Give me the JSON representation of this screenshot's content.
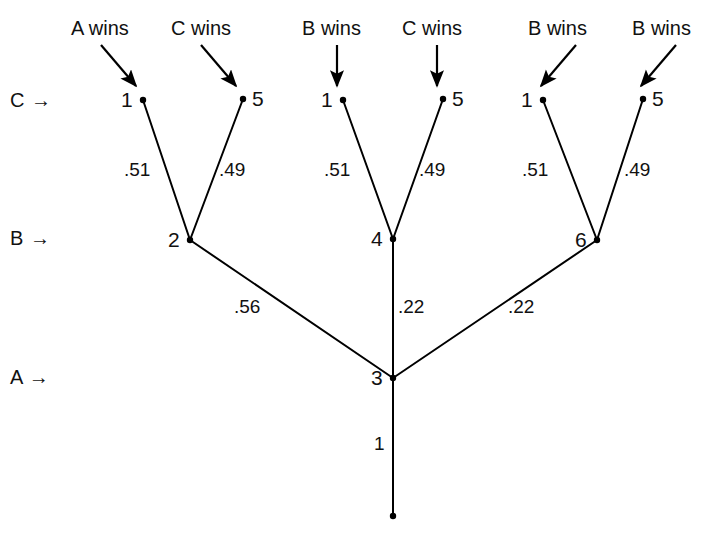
{
  "figure": {
    "type": "tree-diagram",
    "background": "#ffffff",
    "ink": "#000000",
    "width": 715,
    "height": 538
  },
  "row_labels": [
    {
      "text": "C →",
      "x": 10,
      "y": 90
    },
    {
      "text": "B →",
      "x": 10,
      "y": 228
    },
    {
      "text": "A →",
      "x": 10,
      "y": 367
    }
  ],
  "captions": [
    {
      "text": "A wins",
      "x": 71,
      "y": 18,
      "arrow": "diagonal-right-down"
    },
    {
      "text": "C wins",
      "x": 171,
      "y": 18,
      "arrow": "diagonal-right-down"
    },
    {
      "text": "B wins",
      "x": 302,
      "y": 18,
      "arrow": "vertical-down"
    },
    {
      "text": "C wins",
      "x": 402,
      "y": 18,
      "arrow": "vertical-down"
    },
    {
      "text": "B wins",
      "x": 528,
      "y": 18,
      "arrow": "diagonal-left-down"
    },
    {
      "text": "B wins",
      "x": 632,
      "y": 18,
      "arrow": "diagonal-left-down"
    }
  ],
  "arrows": [
    {
      "name": "arrow-a-wins",
      "x1": 101,
      "y1": 45,
      "x2": 136,
      "y2": 86
    },
    {
      "name": "arrow-c-wins-1",
      "x1": 201,
      "y1": 45,
      "x2": 236,
      "y2": 86
    },
    {
      "name": "arrow-b-wins-1",
      "x1": 337,
      "y1": 45,
      "x2": 337,
      "y2": 86
    },
    {
      "name": "arrow-c-wins-2",
      "x1": 437,
      "y1": 45,
      "x2": 437,
      "y2": 86
    },
    {
      "name": "arrow-b-wins-2",
      "x1": 576,
      "y1": 45,
      "x2": 541,
      "y2": 86
    },
    {
      "name": "arrow-b-wins-3",
      "x1": 676,
      "y1": 45,
      "x2": 641,
      "y2": 86
    }
  ],
  "nodes": [
    {
      "name": "node-c-left-1",
      "id": "1",
      "x": 143,
      "y": 100,
      "label_side": "left"
    },
    {
      "name": "node-c-left-5",
      "id": "5",
      "x": 243,
      "y": 99,
      "label_side": "right"
    },
    {
      "name": "node-c-mid-1",
      "id": "1",
      "x": 343,
      "y": 100,
      "label_side": "left"
    },
    {
      "name": "node-c-mid-5",
      "id": "5",
      "x": 443,
      "y": 99,
      "label_side": "right"
    },
    {
      "name": "node-c-right-1",
      "id": "1",
      "x": 543,
      "y": 100,
      "label_side": "left"
    },
    {
      "name": "node-c-right-5",
      "id": "5",
      "x": 643,
      "y": 99,
      "label_side": "right"
    },
    {
      "name": "node-b-left-2",
      "id": "2",
      "x": 190,
      "y": 240,
      "label_side": "left"
    },
    {
      "name": "node-b-mid-4",
      "id": "4",
      "x": 393,
      "y": 239,
      "label_side": "left"
    },
    {
      "name": "node-b-right-6",
      "id": "6",
      "x": 597,
      "y": 240,
      "label_side": "left"
    },
    {
      "name": "node-a-root-3",
      "id": "3",
      "x": 393,
      "y": 378,
      "label_side": "left"
    },
    {
      "name": "node-root-tip",
      "id": "",
      "x": 393,
      "y": 516,
      "label_side": "none"
    }
  ],
  "edges": [
    {
      "name": "edge-1-to-2-left",
      "x1": 143,
      "y1": 100,
      "x2": 190,
      "y2": 240,
      "weight": ".51",
      "wx": 124,
      "wy": 160
    },
    {
      "name": "edge-5-to-2-left",
      "x1": 243,
      "y1": 99,
      "x2": 190,
      "y2": 240,
      "weight": ".49",
      "wx": 219,
      "wy": 160
    },
    {
      "name": "edge-1-to-4-mid",
      "x1": 343,
      "y1": 100,
      "x2": 393,
      "y2": 239,
      "weight": ".51",
      "wx": 324,
      "wy": 160
    },
    {
      "name": "edge-5-to-4-mid",
      "x1": 443,
      "y1": 99,
      "x2": 393,
      "y2": 239,
      "weight": ".49",
      "wx": 419,
      "wy": 160
    },
    {
      "name": "edge-1-to-6-right",
      "x1": 543,
      "y1": 100,
      "x2": 597,
      "y2": 240,
      "weight": ".51",
      "wx": 522,
      "wy": 160
    },
    {
      "name": "edge-5-to-6-right",
      "x1": 643,
      "y1": 99,
      "x2": 597,
      "y2": 240,
      "weight": ".49",
      "wx": 624,
      "wy": 160
    },
    {
      "name": "edge-2-to-3",
      "x1": 190,
      "y1": 240,
      "x2": 393,
      "y2": 378,
      "weight": ".56",
      "wx": 234,
      "wy": 297
    },
    {
      "name": "edge-4-to-3",
      "x1": 393,
      "y1": 239,
      "x2": 393,
      "y2": 378,
      "weight": ".22",
      "wx": 398,
      "wy": 297
    },
    {
      "name": "edge-6-to-3",
      "x1": 597,
      "y1": 240,
      "x2": 393,
      "y2": 378,
      "weight": ".22",
      "wx": 508,
      "wy": 297
    },
    {
      "name": "edge-3-to-root",
      "x1": 393,
      "y1": 378,
      "x2": 393,
      "y2": 516,
      "weight": "1",
      "wx": 374,
      "wy": 434
    }
  ],
  "chart_data": {
    "type": "tree",
    "title": "",
    "levels": [
      "A",
      "B",
      "C"
    ],
    "level_order_top_to_bottom": [
      "C",
      "B",
      "A"
    ],
    "root": {
      "id": "3",
      "level": "A",
      "stem_weight": "1"
    },
    "branches": [
      {
        "parent": "3",
        "child": "2",
        "level": "B",
        "weight": ".56",
        "leaves": [
          {
            "id": "1",
            "weight": ".51",
            "outcome": "A wins"
          },
          {
            "id": "5",
            "weight": ".49",
            "outcome": "C wins"
          }
        ]
      },
      {
        "parent": "3",
        "child": "4",
        "level": "B",
        "weight": ".22",
        "leaves": [
          {
            "id": "1",
            "weight": ".51",
            "outcome": "B wins"
          },
          {
            "id": "5",
            "weight": ".49",
            "outcome": "C wins"
          }
        ]
      },
      {
        "parent": "3",
        "child": "6",
        "level": "B",
        "weight": ".22",
        "leaves": [
          {
            "id": "1",
            "weight": ".51",
            "outcome": "B wins"
          },
          {
            "id": "5",
            "weight": ".49",
            "outcome": "B wins"
          }
        ]
      }
    ]
  }
}
